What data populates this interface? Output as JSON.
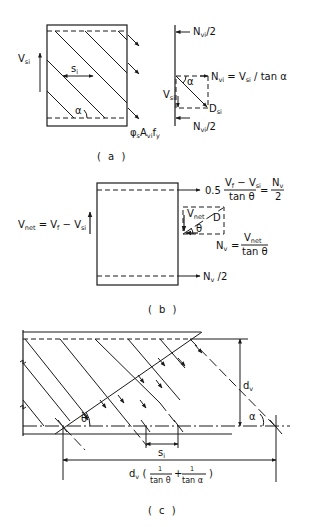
{
  "panels": {
    "a": {
      "caption": "( a )",
      "labels": {
        "v_si": "V",
        "v_si_sub": "si",
        "s_i": "s",
        "s_i_sub": "i",
        "alpha": "α",
        "phi": "φ",
        "phi_sub": "s",
        "a_vi": "A",
        "a_vi_sub": "vi",
        "f_y": "f",
        "f_y_sub": "y",
        "n_vi_top": "N",
        "n_vi_top_sub": "vi",
        "n_vi_top_tail": "/2",
        "n_vi_eq": "N",
        "n_vi_eq_sub": "vi",
        "n_vi_eq_rest": " = V",
        "n_vi_eq_sub2": "si",
        "n_vi_eq_tail": " / tan α",
        "force_v": "V",
        "force_v_sub": "si",
        "d_si": "D",
        "d_si_sub": "si",
        "force_alpha": "α",
        "n_vi_bottom": "N",
        "n_vi_bottom_sub": "vi",
        "n_vi_bottom_tail": "/2"
      }
    },
    "b": {
      "caption": "( b )",
      "labels": {
        "v_net_lhs": "V",
        "v_net_lhs_sub": "net",
        "v_net_eq": " = V",
        "v_f_sub": "f",
        "minus_v": " − V",
        "minus_v_sub": "si",
        "coef": "0.5",
        "num_v": "V",
        "num_v_sub": "f",
        "num_minus": " − V",
        "num_minus_sub": "si",
        "den": "tan θ",
        "eq": "=",
        "rhs_num": "N",
        "rhs_num_sub": "v",
        "rhs_den": "2",
        "tri_v": "V",
        "tri_v_sub": "net",
        "tri_d": "D",
        "tri_theta": "θ",
        "nv": "N",
        "nv_sub": "v",
        "nv_eq": "=",
        "nv_num": "V",
        "nv_num_sub": "net",
        "nv_den": "tan θ",
        "bottom_force": "N",
        "bottom_force_sub": "v",
        "bottom_force_tail": " /2"
      }
    },
    "c": {
      "caption": "( c )",
      "labels": {
        "theta": "θ",
        "alpha": "α",
        "d_v": "d",
        "d_v_sub": "v",
        "s_i": "s",
        "s_i_sub": "i",
        "span": "d",
        "span_sub": "v",
        "span_open": " (",
        "frac1_num": "1",
        "frac1_den": "tan θ",
        "plus": "+",
        "frac2_num": "1",
        "frac2_den": "tan α",
        "span_close": ")"
      }
    }
  }
}
